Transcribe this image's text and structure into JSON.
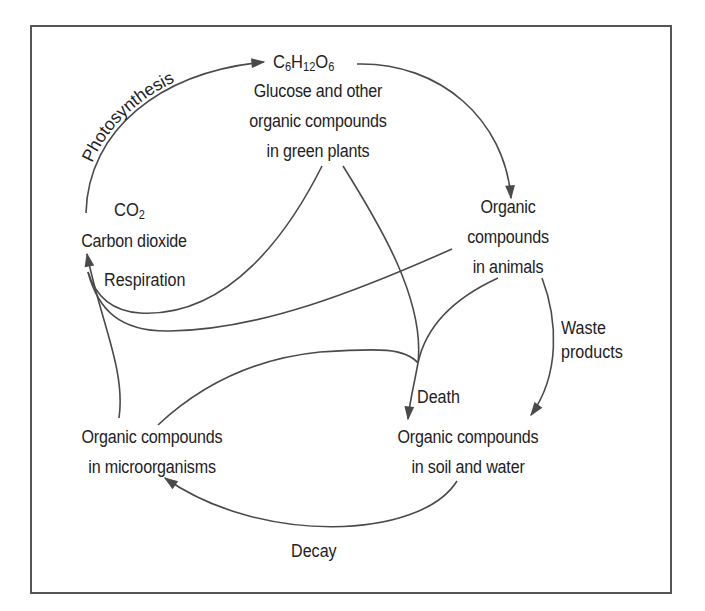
{
  "diagram": {
    "nodes": {
      "glucose": {
        "formula": {
          "c": "C",
          "c_n": "6",
          "h": "H",
          "h_n": "12",
          "o": "O",
          "o_n": "6"
        },
        "lines": [
          "Glucose and other",
          "organic compounds",
          "in green plants"
        ]
      },
      "co2": {
        "formula": {
          "c": "CO",
          "n": "2"
        },
        "lines": [
          "Carbon dioxide"
        ]
      },
      "animals": {
        "lines": [
          "Organic",
          "compounds",
          "in animals"
        ]
      },
      "microorganisms": {
        "lines": [
          "Organic compounds",
          "in microorganisms"
        ]
      },
      "soil_water": {
        "lines": [
          "Organic compounds",
          "in soil and water"
        ]
      }
    },
    "edges": {
      "photosynthesis": "Photosynthesis",
      "respiration": "Respiration",
      "waste": [
        "Waste",
        "products"
      ],
      "death": "Death",
      "decay": "Decay"
    },
    "colors": {
      "line": "#4a4a4a",
      "text": "#222222",
      "frame": "#555555"
    }
  }
}
